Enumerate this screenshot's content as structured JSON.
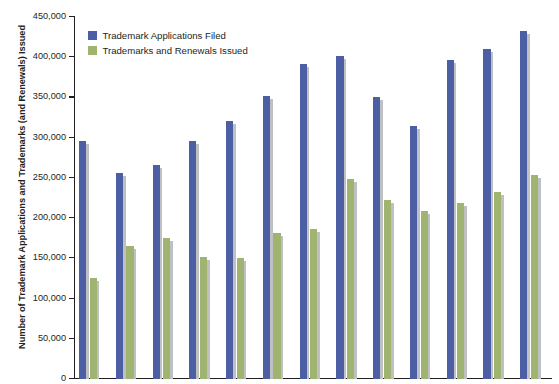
{
  "chart_data": {
    "type": "bar",
    "title": "",
    "subtitle": "",
    "xlabel": "",
    "ylabel": "Number of Trademark Applications and Trademarks (and Renewals) Issued",
    "ylim": [
      0,
      450000
    ],
    "ytick_values": [
      0,
      50000,
      100000,
      150000,
      200000,
      250000,
      300000,
      350000,
      400000,
      450000
    ],
    "ytick_labels": [
      "0",
      "50,000",
      "100,000",
      "150,000",
      "200,000",
      "250,000",
      "300,000",
      "350,000",
      "400,000",
      "450,000"
    ],
    "categories": [
      "2001",
      "2002",
      "2003",
      "2004",
      "2005",
      "2006",
      "2007",
      "2008",
      "2009",
      "2010",
      "2011",
      "2012",
      "2013"
    ],
    "xtick_labels_shown": [
      "2001",
      "2003",
      "2005",
      "2007",
      "2009",
      "2011",
      "2013"
    ],
    "grid": false,
    "legend_position": "top-left",
    "series": [
      {
        "name": "Trademark Applications Filed",
        "color": "#4c5fa5",
        "values": [
          296000,
          256000,
          266000,
          296000,
          321000,
          352000,
          391000,
          401000,
          351000,
          315000,
          396000,
          410000,
          432000
        ]
      },
      {
        "name": "Trademarks and Renewals Issued",
        "color": "#a0b471",
        "values": [
          125000,
          165000,
          175000,
          152000,
          150000,
          181000,
          186000,
          249000,
          222000,
          209000,
          219000,
          233000,
          253000
        ]
      }
    ]
  },
  "legend": {
    "items": [
      {
        "label": "Trademark Applications Filed",
        "color": "#4c5fa5"
      },
      {
        "label": "Trademarks and Renewals Issued",
        "color": "#a0b471"
      }
    ]
  },
  "axis": {
    "y_title": "Number of Trademark Applications and Trademarks (and Renewals) Issued"
  },
  "colors": {
    "series_blue": "#4c5fa5",
    "series_green": "#a0b471",
    "bar_shadow": "#bfc0c2",
    "axis": "#231f20",
    "background": "#ffffff"
  }
}
